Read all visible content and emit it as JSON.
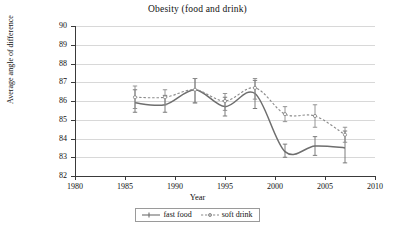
{
  "chart_data": {
    "type": "line",
    "title": "Obesity (food and drink)",
    "xlabel": "Year",
    "ylabel": "Average angle of difference",
    "xlim": [
      1980,
      2010
    ],
    "ylim": [
      82,
      90
    ],
    "xticks": [
      1980,
      1985,
      1990,
      1995,
      2000,
      2005,
      2010
    ],
    "yticks": [
      82,
      83,
      84,
      85,
      86,
      87,
      88,
      89,
      90
    ],
    "grid": true,
    "legend_position": "bottom-center",
    "error_bars": true,
    "series": [
      {
        "name": "fast food",
        "style": "solid",
        "color": "#6e6e6e",
        "x": [
          1986,
          1989,
          1992,
          1995,
          1998,
          2001,
          2004,
          2007
        ],
        "values": [
          85.9,
          85.8,
          86.6,
          85.7,
          86.4,
          83.3,
          83.6,
          83.5
        ],
        "err_low": [
          85.4,
          85.4,
          85.9,
          85.2,
          85.6,
          83.0,
          83.1,
          82.7
        ],
        "err_high": [
          86.6,
          86.3,
          87.2,
          86.2,
          87.1,
          83.7,
          84.1,
          84.4
        ]
      },
      {
        "name": "soft drink",
        "style": "dashed",
        "color": "#8a8a8a",
        "x": [
          1986,
          1989,
          1992,
          1995,
          1998,
          2001,
          2004,
          2007
        ],
        "values": [
          86.2,
          86.2,
          86.6,
          86.0,
          86.7,
          85.3,
          85.2,
          84.2
        ],
        "err_low": [
          85.6,
          85.8,
          85.9,
          85.5,
          86.1,
          84.9,
          84.6,
          83.8
        ],
        "err_high": [
          86.8,
          86.6,
          87.2,
          86.4,
          87.2,
          85.7,
          85.8,
          84.6
        ]
      }
    ]
  },
  "legend": {
    "items": [
      {
        "label": "fast food"
      },
      {
        "label": "soft drink"
      }
    ]
  }
}
